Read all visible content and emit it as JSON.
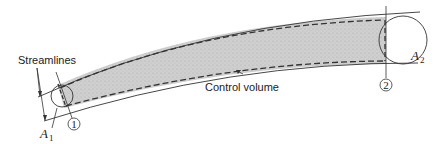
{
  "diagram": {
    "labels": {
      "streamlines": "Streamlines",
      "control_volume": "Control volume",
      "area_1": "A",
      "area_1_sub": "1",
      "area_2": "A",
      "area_2_sub": "2",
      "section_1": "1",
      "section_2": "2"
    },
    "colors": {
      "fill": "#c8c8c8",
      "stroke": "#333333",
      "background": "#ffffff"
    }
  }
}
